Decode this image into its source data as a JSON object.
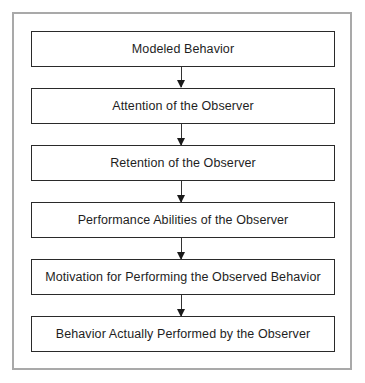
{
  "diagram": {
    "type": "flowchart",
    "direction": "top-to-bottom",
    "steps": [
      {
        "label": "Modeled Behavior"
      },
      {
        "label": "Attention of the Observer"
      },
      {
        "label": "Retention of the Observer"
      },
      {
        "label": "Performance Abilities of the Observer"
      },
      {
        "label": "Motivation for Performing the Observed Behavior"
      },
      {
        "label": "Behavior Actually Performed by the Observer"
      }
    ],
    "connections": [
      {
        "from": 0,
        "to": 1
      },
      {
        "from": 1,
        "to": 2
      },
      {
        "from": 2,
        "to": 3
      },
      {
        "from": 3,
        "to": 4
      },
      {
        "from": 4,
        "to": 5
      }
    ],
    "colors": {
      "box_border": "#2a2a2a",
      "frame_border": "#a9a9a9",
      "text": "#1e1e1e",
      "arrow": "#1a1a1a"
    }
  }
}
